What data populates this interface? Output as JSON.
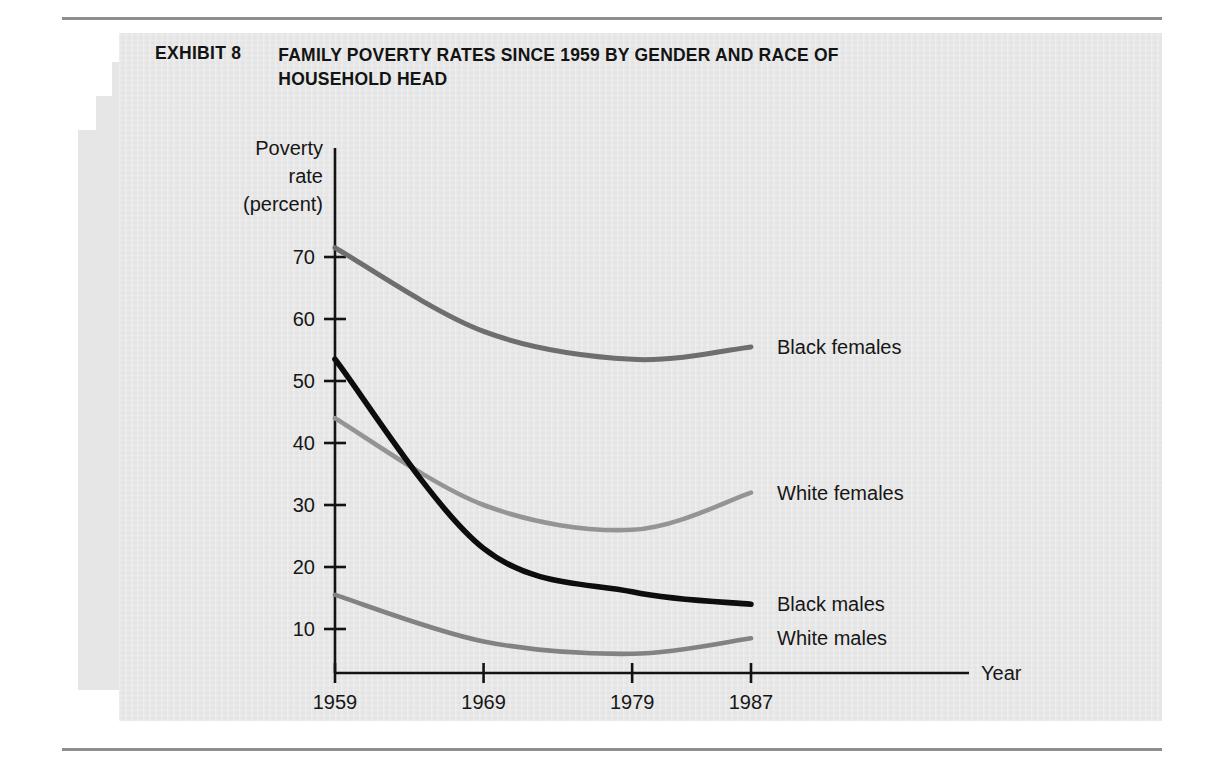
{
  "exhibit": {
    "label": "EXHIBIT 8",
    "title": "FAMILY POVERTY RATES SINCE 1959 BY GENDER AND RACE OF HOUSEHOLD HEAD"
  },
  "chart_data": {
    "type": "line",
    "title": "FAMILY POVERTY RATES SINCE 1959 BY GENDER AND RACE OF HOUSEHOLD HEAD",
    "xlabel": "Year",
    "ylabel": "Poverty rate (percent)",
    "ylabel_lines": [
      "Poverty",
      "rate",
      "(percent)"
    ],
    "x": [
      1959,
      1969,
      1979,
      1987
    ],
    "xtick_labels": [
      "1959",
      "1969",
      "1979",
      "1987"
    ],
    "ytick_labels": [
      "10",
      "20",
      "30",
      "40",
      "50",
      "60",
      "70"
    ],
    "yticks": [
      10,
      20,
      30,
      40,
      50,
      60,
      70
    ],
    "ylim": [
      0,
      75
    ],
    "xlim": [
      1959,
      1987
    ],
    "grid": false,
    "legend_position": "right-inline",
    "series": [
      {
        "name": "Black females",
        "values": [
          71.5,
          58.0,
          53.5,
          55.5
        ],
        "color": "#6e6e6e",
        "width": 5.0
      },
      {
        "name": "White females",
        "values": [
          44.0,
          30.0,
          26.0,
          32.0
        ],
        "color": "#949494",
        "width": 4.6
      },
      {
        "name": "Black males",
        "values": [
          53.5,
          23.0,
          16.0,
          14.0
        ],
        "color": "#0d0d0d",
        "width": 5.6
      },
      {
        "name": "White males",
        "values": [
          15.5,
          8.0,
          6.0,
          8.5
        ],
        "color": "#828282",
        "width": 4.6
      }
    ]
  },
  "colors": {
    "panel_background": "#e8e8e8",
    "page_background": "#ffffff",
    "rule": "#8e8e8e",
    "axis": "#131313",
    "text": "#131313"
  }
}
